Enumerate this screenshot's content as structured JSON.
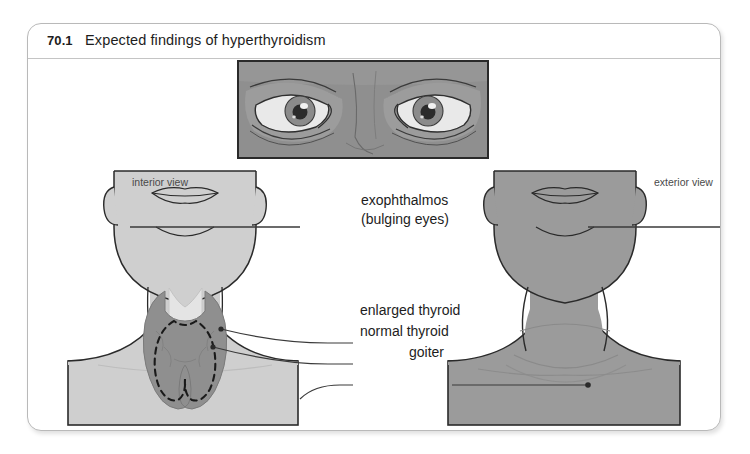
{
  "figure": {
    "number": "70.1",
    "title": "Expected findings of hyperthyroidism"
  },
  "panels": {
    "eyes": {
      "name": "eye-illustration-panel"
    },
    "interior": {
      "view_label": "interior view"
    },
    "exterior": {
      "view_label": "exterior view"
    }
  },
  "annotations": {
    "exophthalmos_line1": "exophthalmos",
    "exophthalmos_line2": "(bulging eyes)",
    "enlarged_thyroid": "enlarged thyroid",
    "normal_thyroid": "normal thyroid",
    "goiter": "goiter"
  },
  "colors": {
    "page_background": "#ffffff",
    "box_border": "#b9b9b9",
    "caption_rule": "#c4c4c4",
    "text": "#1d1d1d",
    "view_label_text": "#4a4a4a",
    "skin_light": "#cfcfcf",
    "skin_light_shade": "#c3c3c3",
    "skin_dark": "#9b9b9b",
    "skin_dark_shade": "#929292",
    "eye_panel_bg": "#8f8f8f",
    "sclera": "#e9e9e9",
    "iris": "#8b8b8b",
    "pupil": "#2b2b2b",
    "highlight": "#f2f2f2",
    "thyroid_enlarged": "#8f8f8f",
    "trachea": "#e4e4e4",
    "outline": "#2a2a2a",
    "leader_line": "#3a3a3a"
  }
}
